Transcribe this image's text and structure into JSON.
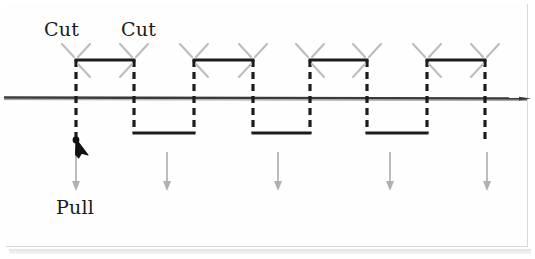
{
  "figure": {
    "title": "",
    "labels": {
      "cut_1": "Cut",
      "cut_2": "Cut",
      "pull": "Pull"
    },
    "colors": {
      "line": "#1c1c1c",
      "baseline": "#3a3a3a",
      "cut_mark": "#b8b8b8",
      "arrow": "#a8a8a8",
      "pull_arrow": "#111111",
      "background": "#ffffff",
      "frame": "#d9d9d9"
    },
    "geometry": {
      "baseline_y": 98,
      "top_plateau_y": 60,
      "bottom_plateau_y": 133,
      "transition_x": [
        76,
        134,
        194,
        253,
        310,
        367,
        427,
        485
      ],
      "dash_pattern": "7,5",
      "wave_stroke_width": 3,
      "baseline_stroke_width": 2
    },
    "cut_marks": {
      "description": "gray X-shaped scissor cut marks at each top-plateau corner",
      "count": 16,
      "x_positions": [
        76,
        134,
        194,
        253,
        310,
        367,
        427,
        485
      ]
    },
    "pull_arrow": {
      "description": "black upward pointer at end of first dashed drop line",
      "tip_x": 76,
      "tip_y": 139
    },
    "down_arrows": {
      "description": "gray downward arrows indicating pulling direction",
      "x_positions": [
        76,
        167,
        278,
        390,
        487
      ],
      "top_y": 150,
      "bottom_y": 190
    }
  }
}
